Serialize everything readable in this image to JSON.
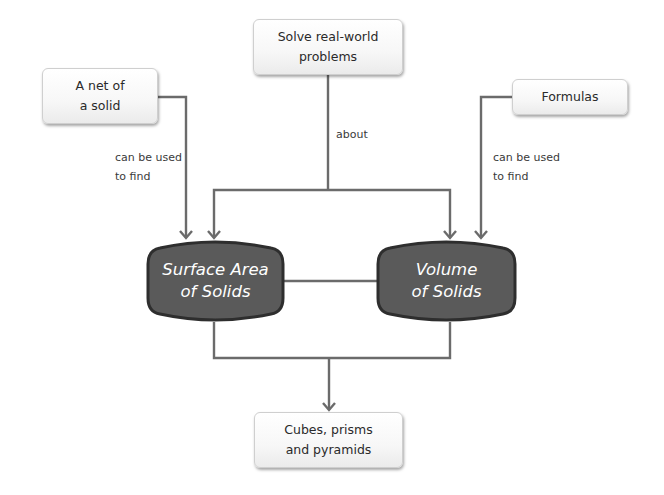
{
  "diagram": {
    "nodes": {
      "net": {
        "lines": [
          "A net of",
          "a solid"
        ]
      },
      "solve": {
        "lines": [
          "Solve real-world",
          "problems"
        ]
      },
      "formulas": {
        "lines": [
          "Formulas"
        ]
      },
      "surface_area": {
        "lines": [
          "Surface Area",
          "of Solids"
        ]
      },
      "volume": {
        "lines": [
          "Volume",
          "of Solids"
        ]
      },
      "solids": {
        "lines": [
          "Cubes, prisms",
          "and pyramids"
        ]
      }
    },
    "edge_labels": {
      "net_to_surface": [
        "can be used",
        "to find"
      ],
      "solve_to_both": [
        "about"
      ],
      "formulas_to_volume": [
        "can be used",
        "to find"
      ]
    },
    "colors": {
      "connector": "#6b6b6b",
      "hub_fill": "#5a5a5a",
      "hub_border": "#2e2e2e",
      "hub_text": "#ffffff",
      "box_border": "#cfcfcf"
    }
  }
}
